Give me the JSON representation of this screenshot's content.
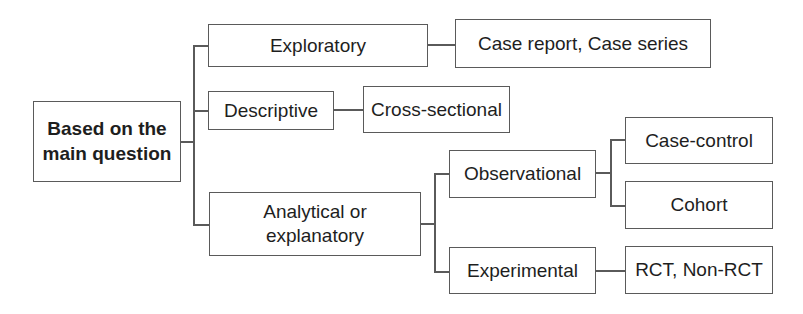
{
  "diagram": {
    "type": "tree",
    "root": {
      "label_line1": "Based on the",
      "label_line2": "main question"
    },
    "nodes": {
      "exploratory": {
        "label": "Exploratory"
      },
      "case_report": {
        "label": "Case report, Case series"
      },
      "descriptive": {
        "label": "Descriptive"
      },
      "cross_sectional": {
        "label": "Cross-sectional"
      },
      "analytical": {
        "label_line1": "Analytical or",
        "label_line2": "explanatory"
      },
      "observational": {
        "label": "Observational"
      },
      "case_control": {
        "label": "Case-control"
      },
      "cohort": {
        "label": "Cohort"
      },
      "experimental": {
        "label": "Experimental"
      },
      "rct": {
        "label": "RCT, Non-RCT"
      }
    },
    "edges": [
      [
        "root",
        "exploratory"
      ],
      [
        "root",
        "descriptive"
      ],
      [
        "root",
        "analytical"
      ],
      [
        "exploratory",
        "case_report"
      ],
      [
        "descriptive",
        "cross_sectional"
      ],
      [
        "analytical",
        "observational"
      ],
      [
        "analytical",
        "experimental"
      ],
      [
        "observational",
        "case_control"
      ],
      [
        "observational",
        "cohort"
      ],
      [
        "experimental",
        "rct"
      ]
    ],
    "colors": {
      "border": "#5a5a5a",
      "text": "#1e1e1e",
      "background": "#ffffff"
    }
  }
}
